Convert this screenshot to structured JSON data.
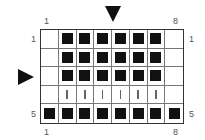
{
  "chart": {
    "columns": 8,
    "rows": 5,
    "top_labels": {
      "left": "1",
      "right": "8"
    },
    "bottom_labels": {
      "left": "1",
      "right": "8"
    },
    "left_labels": {
      "top": "1",
      "bottom": "5"
    },
    "right_labels": {
      "top": "1",
      "bottom": "5"
    },
    "markers": {
      "down_arrow": "between column 4 and 5 (top)",
      "right_arrow": "row 3 (left)"
    },
    "legend_symbols": {
      "filled-square": "solid black square",
      "vertical-bar": "thin vertical line",
      "empty": "blank cell"
    },
    "cells": [
      [
        "empty",
        "filled-square",
        "filled-square",
        "filled-square",
        "filled-square",
        "filled-square",
        "filled-square",
        "empty"
      ],
      [
        "empty",
        "filled-square",
        "filled-square",
        "filled-square",
        "filled-square",
        "filled-square",
        "filled-square",
        "empty"
      ],
      [
        "empty",
        "filled-square",
        "filled-square",
        "filled-square",
        "filled-square",
        "filled-square",
        "filled-square",
        "empty"
      ],
      [
        "empty",
        "vertical-bar",
        "vertical-bar",
        "vertical-bar",
        "vertical-bar",
        "vertical-bar",
        "vertical-bar",
        "empty"
      ],
      [
        "filled-square",
        "filled-square",
        "filled-square",
        "filled-square",
        "filled-square",
        "filled-square",
        "filled-square",
        "filled-square"
      ]
    ]
  }
}
